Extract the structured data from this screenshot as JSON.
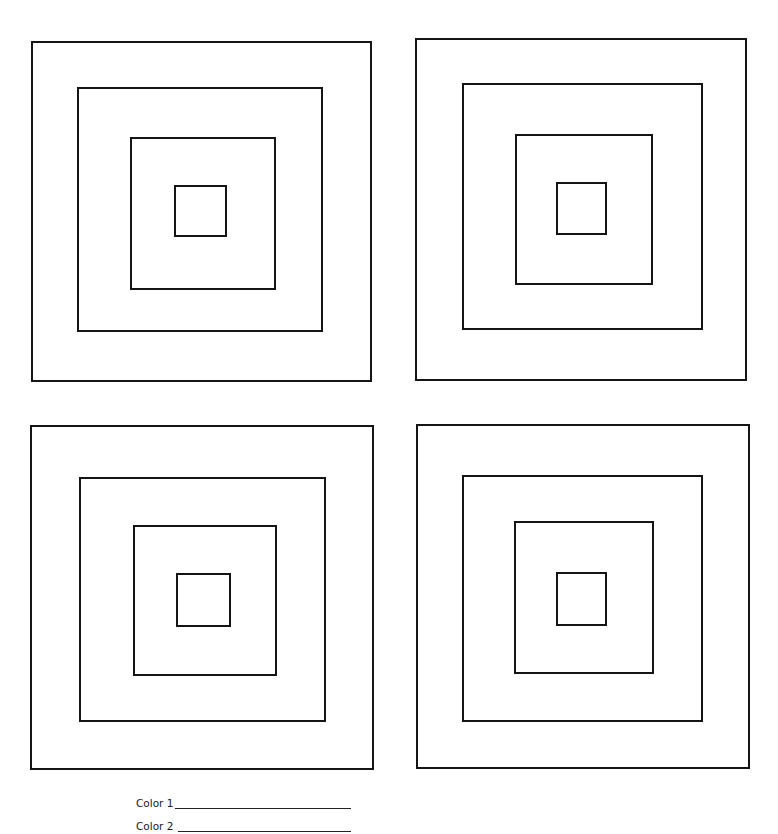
{
  "worksheet": {
    "type": "coloring-page",
    "stroke_color": "#151515",
    "background": "#ffffff",
    "panels": [
      {
        "name": "top-left",
        "squares": [
          {
            "x": 31,
            "y": 41,
            "w": 341,
            "h": 341
          },
          {
            "x": 77,
            "y": 87,
            "w": 246,
            "h": 245
          },
          {
            "x": 130,
            "y": 137,
            "w": 146,
            "h": 153
          },
          {
            "x": 174,
            "y": 185,
            "w": 53,
            "h": 52
          }
        ]
      },
      {
        "name": "top-right",
        "squares": [
          {
            "x": 415,
            "y": 38,
            "w": 332,
            "h": 343
          },
          {
            "x": 462,
            "y": 83,
            "w": 241,
            "h": 247
          },
          {
            "x": 515,
            "y": 134,
            "w": 138,
            "h": 151
          },
          {
            "x": 556,
            "y": 182,
            "w": 51,
            "h": 53
          }
        ]
      },
      {
        "name": "bottom-left",
        "squares": [
          {
            "x": 30,
            "y": 425,
            "w": 344,
            "h": 345
          },
          {
            "x": 79,
            "y": 477,
            "w": 247,
            "h": 245
          },
          {
            "x": 133,
            "y": 525,
            "w": 144,
            "h": 151
          },
          {
            "x": 176,
            "y": 573,
            "w": 55,
            "h": 54
          }
        ]
      },
      {
        "name": "bottom-right",
        "squares": [
          {
            "x": 416,
            "y": 424,
            "w": 334,
            "h": 345
          },
          {
            "x": 462,
            "y": 475,
            "w": 241,
            "h": 247
          },
          {
            "x": 514,
            "y": 521,
            "w": 140,
            "h": 153
          },
          {
            "x": 556,
            "y": 572,
            "w": 51,
            "h": 54
          }
        ]
      }
    ]
  },
  "fields": [
    {
      "label": "Color 1",
      "value": "",
      "top": 797,
      "line_width": 176
    },
    {
      "label": "Color 2",
      "value": "",
      "top": 820,
      "line_width": 173
    }
  ]
}
